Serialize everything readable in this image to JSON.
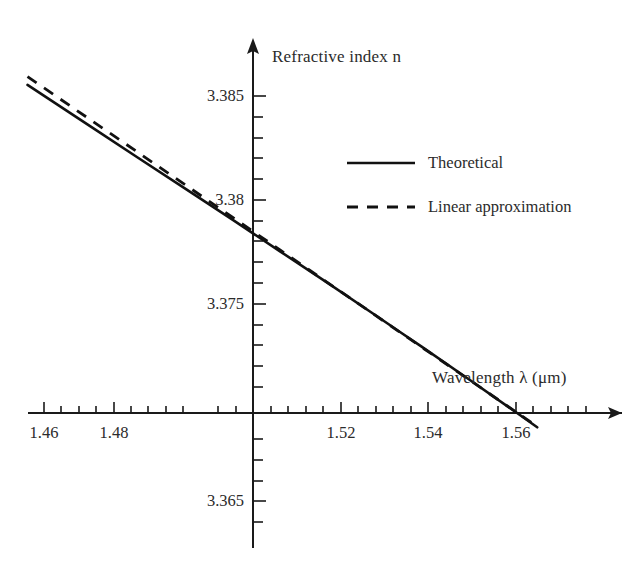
{
  "chart_data": {
    "type": "line",
    "title": "",
    "xlabel": "Wavelength  λ (μm)",
    "ylabel": "Refractive index  n",
    "xlim": [
      1.4545,
      1.5645
    ],
    "ylim": [
      3.3625,
      3.3875
    ],
    "grid": false,
    "legend_position": "upper right",
    "x_ticks_major": [
      1.46,
      1.48,
      1.5,
      1.52,
      1.54,
      1.56
    ],
    "x_tick_labels": [
      "1.46",
      "1.48",
      "",
      "1.52",
      "1.54",
      "1.56"
    ],
    "x_tick_minor_step": 0.005,
    "y_ticks_major": [
      3.385,
      3.38,
      3.375,
      3.365
    ],
    "y_tick_labels": [
      "3.385",
      "3.38",
      "3.375",
      "3.365"
    ],
    "y_tick_minor_step": 0.001,
    "x_axis_crosses_y_at": 3.3697,
    "y_axis_crosses_x_at": 1.5,
    "series": [
      {
        "name": "Theoretical",
        "style": "solid",
        "color": "#111111",
        "x": [
          1.4565,
          1.47,
          1.48,
          1.49,
          1.5,
          1.51,
          1.52,
          1.53,
          1.5355,
          1.54,
          1.55,
          1.56,
          1.5645
        ],
        "y": [
          3.38555,
          3.38348,
          3.38194,
          3.38041,
          3.37888,
          3.37733,
          3.37578,
          3.37421,
          3.37333,
          3.37262,
          3.37101,
          3.36938,
          3.36864
        ]
      },
      {
        "name": "Linear approximation",
        "style": "dashed",
        "color": "#111111",
        "x": [
          1.4565,
          1.47,
          1.48,
          1.49,
          1.5,
          1.51,
          1.52,
          1.53,
          1.5355,
          1.54,
          1.55,
          1.56,
          1.5645
        ],
        "y": [
          3.38596,
          3.3838,
          3.3822,
          3.3806,
          3.379,
          3.3774,
          3.3758,
          3.3742,
          3.37332,
          3.3726,
          3.371,
          3.3694,
          3.36868
        ]
      }
    ],
    "legend": [
      {
        "label": "Theoretical",
        "style": "solid"
      },
      {
        "label": "Linear approximation",
        "style": "dashed"
      }
    ]
  },
  "axes": {
    "y_label": "Refractive index  n",
    "x_label": "Wavelength  λ (μm)",
    "y_tick_values": [
      "3.385",
      "3.38",
      "3.375",
      "3.365"
    ],
    "x_tick_values": [
      "1.46",
      "1.48",
      "1.52",
      "1.54",
      "1.56"
    ]
  },
  "legend": {
    "theoretical_label": "Theoretical",
    "linear_label": "Linear approximation"
  },
  "colors": {
    "line": "#111111",
    "axis": "#1a1a1a",
    "text": "#2b2b2b",
    "background": "#ffffff"
  }
}
